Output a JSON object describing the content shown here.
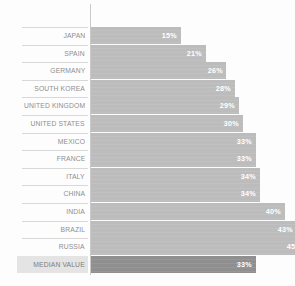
{
  "chart_data": {
    "type": "bar",
    "orientation": "horizontal",
    "title": "",
    "xlabel": "",
    "ylabel": "",
    "grid": false,
    "legend": false,
    "xlim": [
      0,
      50
    ],
    "value_suffix": "%",
    "categories": [
      "JAPAN",
      "SPAIN",
      "GERMANY",
      "SOUTH KOREA",
      "UNITED KINGDOM",
      "UNITED STATES",
      "MEXICO",
      "FRANCE",
      "ITALY",
      "CHINA",
      "INDIA",
      "BRAZIL",
      "RUSSIA",
      "MEDIAN VALUE"
    ],
    "values": [
      15,
      21,
      26,
      28,
      29,
      30,
      33,
      33,
      34,
      34,
      40,
      43,
      45,
      33
    ],
    "value_labels": [
      "15%",
      "21%",
      "26%",
      "28%",
      "29%",
      "30%",
      "33%",
      "33%",
      "34%",
      "34%",
      "40%",
      "43%",
      "45%",
      "33%"
    ],
    "highlight_category": "MEDIAN VALUE",
    "colors": {
      "bar": "#bcbcbc",
      "bar_highlight": "#8f8f8f",
      "value_label": "#ffffff",
      "category_label": "#8d8d8d",
      "axis_line": "#c9c9c9",
      "separator": "#d8d8d8",
      "background": "#fdfdfd",
      "highlight_label_plate": "#e4e4e4"
    }
  },
  "rows": [
    {
      "label": "JAPAN",
      "value_label": "15%"
    },
    {
      "label": "SPAIN",
      "value_label": "21%"
    },
    {
      "label": "GERMANY",
      "value_label": "26%"
    },
    {
      "label": "SOUTH KOREA",
      "value_label": "28%"
    },
    {
      "label": "UNITED KINGDOM",
      "value_label": "29%"
    },
    {
      "label": "UNITED STATES",
      "value_label": "30%"
    },
    {
      "label": "MEXICO",
      "value_label": "33%"
    },
    {
      "label": "FRANCE",
      "value_label": "33%"
    },
    {
      "label": "ITALY",
      "value_label": "34%"
    },
    {
      "label": "CHINA",
      "value_label": "34%"
    },
    {
      "label": "INDIA",
      "value_label": "40%"
    },
    {
      "label": "BRAZIL",
      "value_label": "43%"
    },
    {
      "label": "RUSSIA",
      "value_label": "45%"
    },
    {
      "label": "MEDIAN VALUE",
      "value_label": "33%"
    }
  ]
}
